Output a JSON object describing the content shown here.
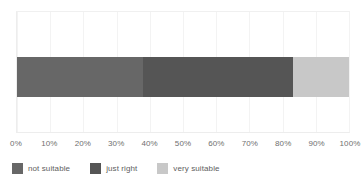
{
  "chart_data": {
    "type": "bar",
    "orientation": "horizontal",
    "stacked": true,
    "title": "",
    "subtitle": "",
    "xlabel": "",
    "ylabel": "",
    "categories": [
      ""
    ],
    "xlim": [
      0,
      100
    ],
    "grid": true,
    "legend_position": "bottom-left",
    "axis_tick_labels": [
      "0%",
      "10%",
      "20%",
      "30%",
      "40%",
      "50%",
      "60%",
      "70%",
      "80%",
      "90%",
      "100%"
    ],
    "axis_tick_values": [
      0,
      10,
      20,
      30,
      40,
      50,
      60,
      70,
      80,
      90,
      100
    ],
    "series": [
      {
        "name": "not suitable",
        "values": [
          38
        ],
        "color": "#676767"
      },
      {
        "name": "just right",
        "values": [
          45
        ],
        "color": "#555555"
      },
      {
        "name": "very suitable",
        "values": [
          17
        ],
        "color": "#c8c8c8"
      }
    ]
  },
  "legend": {
    "items": [
      {
        "label": "not suitable",
        "color": "#676767"
      },
      {
        "label": "just right",
        "color": "#555555"
      },
      {
        "label": "very suitable",
        "color": "#c8c8c8"
      }
    ]
  },
  "colors": {
    "background": "#ffffff",
    "gridline": "#f3f3f3",
    "axis_text": "#6f6f6f",
    "legend_text": "#5e5e5e"
  }
}
